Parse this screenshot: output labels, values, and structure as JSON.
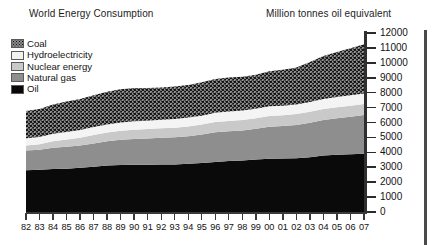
{
  "title": {
    "main": "World Energy Consumption",
    "units": "Million tonnes oil equivalent"
  },
  "legend": {
    "items": [
      {
        "label": "Coal",
        "swatch": "coal-swatch",
        "color": "#585858"
      },
      {
        "label": "Hydroelectricity",
        "swatch": "hydro-swatch",
        "color": "#f2f2f2"
      },
      {
        "label": "Nuclear energy",
        "swatch": "nuclear-swatch",
        "color": "#c9c9c9"
      },
      {
        "label": "Natural gas",
        "swatch": "gas-swatch",
        "color": "#8e8e8e"
      },
      {
        "label": "Oil",
        "swatch": "oil-swatch",
        "color": "#080808"
      }
    ]
  },
  "chart_data": {
    "type": "area",
    "stacked": true,
    "title": "World Energy Consumption",
    "xlabel": "",
    "ylabel": "Million tonnes oil equivalent",
    "ylim": [
      0,
      12000
    ],
    "ytick_step": 1000,
    "yticks": [
      12000,
      11000,
      10000,
      9000,
      8000,
      7000,
      6000,
      5000,
      4000,
      3000,
      2000,
      1000,
      0
    ],
    "grid": false,
    "legend_position": "top-left",
    "categories": [
      "82",
      "83",
      "84",
      "85",
      "86",
      "87",
      "88",
      "89",
      "90",
      "91",
      "92",
      "93",
      "94",
      "95",
      "96",
      "97",
      "98",
      "99",
      "00",
      "01",
      "02",
      "03",
      "04",
      "05",
      "06",
      "07"
    ],
    "series": [
      {
        "name": "Oil",
        "values": [
          2800,
          2830,
          2880,
          2900,
          2960,
          3030,
          3110,
          3150,
          3160,
          3160,
          3190,
          3190,
          3240,
          3290,
          3360,
          3420,
          3450,
          3520,
          3570,
          3590,
          3610,
          3670,
          3780,
          3830,
          3870,
          3900
        ]
      },
      {
        "name": "Natural gas",
        "values": [
          1330,
          1350,
          1430,
          1470,
          1500,
          1570,
          1630,
          1690,
          1740,
          1770,
          1790,
          1820,
          1840,
          1900,
          1980,
          1990,
          2020,
          2060,
          2150,
          2180,
          2230,
          2320,
          2390,
          2450,
          2510,
          2600
        ]
      },
      {
        "name": "Nuclear energy",
        "values": [
          330,
          360,
          430,
          490,
          520,
          560,
          590,
          610,
          620,
          630,
          630,
          640,
          660,
          670,
          690,
          690,
          700,
          710,
          720,
          720,
          730,
          730,
          740,
          740,
          740,
          740
        ]
      },
      {
        "name": "Hydroelectricity",
        "values": [
          480,
          490,
          500,
          510,
          520,
          530,
          540,
          550,
          560,
          560,
          570,
          580,
          590,
          600,
          620,
          630,
          630,
          640,
          650,
          640,
          640,
          650,
          670,
          690,
          700,
          710
        ]
      },
      {
        "name": "Coal",
        "values": [
          1830,
          1880,
          1960,
          2030,
          2070,
          2130,
          2190,
          2230,
          2230,
          2190,
          2170,
          2180,
          2180,
          2230,
          2260,
          2280,
          2260,
          2270,
          2350,
          2400,
          2480,
          2690,
          2880,
          3020,
          3160,
          3300
        ]
      }
    ]
  }
}
